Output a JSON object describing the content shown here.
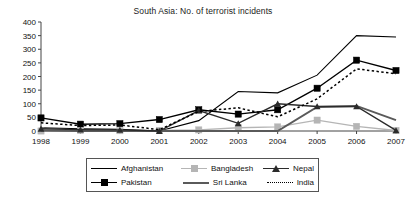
{
  "chart_data": {
    "type": "line",
    "title": "South Asia: No. of terrorist incidents",
    "xlabel": "",
    "ylabel": "",
    "grid": false,
    "legend_position": "bottom",
    "categories": [
      "1998",
      "1999",
      "2000",
      "2001",
      "2002",
      "2003",
      "2004",
      "2005",
      "2006",
      "2007"
    ],
    "x": [
      1998,
      1999,
      2000,
      2001,
      2002,
      2003,
      2004,
      2005,
      2006,
      2007
    ],
    "ylim": [
      0,
      400
    ],
    "ytick_labels": [
      "400",
      "350",
      "300",
      "250",
      "200",
      "150",
      "100",
      "50",
      "0"
    ],
    "yticks": [
      400,
      350,
      300,
      250,
      200,
      150,
      100,
      50,
      0
    ],
    "xtick_labels": [
      "1998",
      "1999",
      "2000",
      "2001",
      "2002",
      "2003",
      "2004",
      "2005",
      "2006",
      "2007"
    ],
    "series": [
      {
        "name": "Afghanistan",
        "color": "#000000",
        "marker": "none",
        "style": "solid",
        "values": [
          12,
          8,
          6,
          0,
          38,
          145,
          140,
          205,
          350,
          345
        ]
      },
      {
        "name": "Pakistan",
        "color": "#000000",
        "marker": "square",
        "style": "solid",
        "values": [
          48,
          25,
          27,
          42,
          78,
          62,
          78,
          157,
          260,
          222
        ]
      },
      {
        "name": "Bangladesh",
        "color": "#b5b5b5",
        "marker": "square",
        "style": "solid",
        "values": [
          0,
          2,
          1,
          2,
          4,
          12,
          15,
          40,
          17,
          2
        ]
      },
      {
        "name": "Sri Lanka",
        "color": "#5a5a5a",
        "marker": "none",
        "style": "solid",
        "values": [
          2,
          0,
          0,
          0,
          0,
          0,
          0,
          88,
          92,
          40
        ]
      },
      {
        "name": "Nepal",
        "color": "#2b2b2b",
        "marker": "triangle",
        "style": "solid",
        "values": [
          8,
          5,
          4,
          0,
          75,
          28,
          100,
          90,
          90,
          2
        ]
      },
      {
        "name": "India",
        "color": "#000000",
        "marker": "none",
        "style": "dotted",
        "values": [
          30,
          20,
          22,
          5,
          72,
          85,
          52,
          118,
          228,
          210
        ]
      }
    ]
  },
  "legend": {
    "rows": [
      [
        {
          "label": "Afghanistan",
          "key": "line-solid-black"
        },
        {
          "label": "Bangladesh",
          "key": "line-solid-gray-square"
        },
        {
          "label": "Nepal",
          "key": "line-solid-triangle"
        }
      ],
      [
        {
          "label": "Pakistan",
          "key": "line-solid-black-square"
        },
        {
          "label": "Sri Lanka",
          "key": "line-solid-darkgray"
        },
        {
          "label": "India",
          "key": "line-dotted-black"
        }
      ]
    ]
  }
}
